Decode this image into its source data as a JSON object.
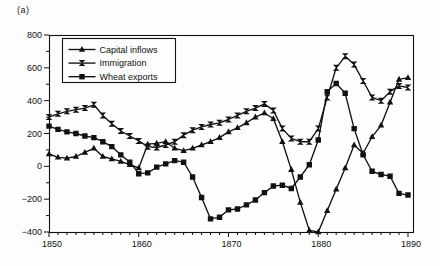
{
  "figure_label": "(a)",
  "chart_data": {
    "type": "line",
    "title": "",
    "xlabel": "",
    "ylabel": "",
    "grid": false,
    "legend_position": "top-left",
    "line_color": "#111111",
    "background": "#fdfdfd",
    "xlim": [
      1850,
      1890
    ],
    "ylim": [
      -400,
      800
    ],
    "x_major_ticks": [
      1850,
      1860,
      1870,
      1880,
      1890
    ],
    "x_minor_step": 1,
    "y_major_ticks": [
      800,
      600,
      400,
      200,
      0,
      -200,
      -400
    ],
    "y_minor_step": 100,
    "y_tick_labels": [
      "800",
      "600",
      "400",
      "200",
      "0",
      "−200",
      "−400"
    ],
    "x_tick_labels": [
      "1850",
      "1860",
      "1870",
      "1880",
      "1890"
    ],
    "x": [
      1850,
      1851,
      1852,
      1853,
      1854,
      1855,
      1856,
      1857,
      1858,
      1859,
      1860,
      1861,
      1862,
      1863,
      1864,
      1865,
      1866,
      1867,
      1868,
      1869,
      1870,
      1871,
      1872,
      1873,
      1874,
      1875,
      1876,
      1877,
      1878,
      1879,
      1880,
      1881,
      1882,
      1883,
      1884,
      1885,
      1886,
      1887,
      1888,
      1889,
      1890
    ],
    "series": [
      {
        "name": "Capital inflows",
        "marker": "triangle",
        "values": [
          75,
          55,
          50,
          60,
          85,
          110,
          60,
          45,
          30,
          10,
          -10,
          135,
          140,
          150,
          110,
          95,
          110,
          130,
          150,
          175,
          210,
          235,
          265,
          300,
          325,
          290,
          150,
          -20,
          -220,
          -390,
          -400,
          -270,
          -140,
          -10,
          130,
          80,
          180,
          250,
          390,
          530,
          540
        ]
      },
      {
        "name": "Immigration",
        "marker": "hourglass",
        "values": [
          300,
          320,
          335,
          345,
          355,
          375,
          310,
          260,
          215,
          185,
          155,
          120,
          115,
          130,
          150,
          190,
          220,
          240,
          255,
          265,
          285,
          310,
          335,
          355,
          380,
          340,
          230,
          170,
          150,
          150,
          230,
          420,
          600,
          670,
          620,
          520,
          420,
          400,
          455,
          490,
          480
        ]
      },
      {
        "name": "Wheat exports",
        "marker": "square",
        "values": [
          245,
          225,
          210,
          200,
          185,
          175,
          150,
          120,
          70,
          25,
          -45,
          -40,
          -5,
          15,
          35,
          25,
          -65,
          -190,
          -320,
          -310,
          -265,
          -260,
          -235,
          -205,
          -160,
          -120,
          -115,
          -135,
          -65,
          10,
          160,
          455,
          505,
          445,
          230,
          70,
          -30,
          -50,
          -60,
          -165,
          -175
        ]
      }
    ]
  }
}
